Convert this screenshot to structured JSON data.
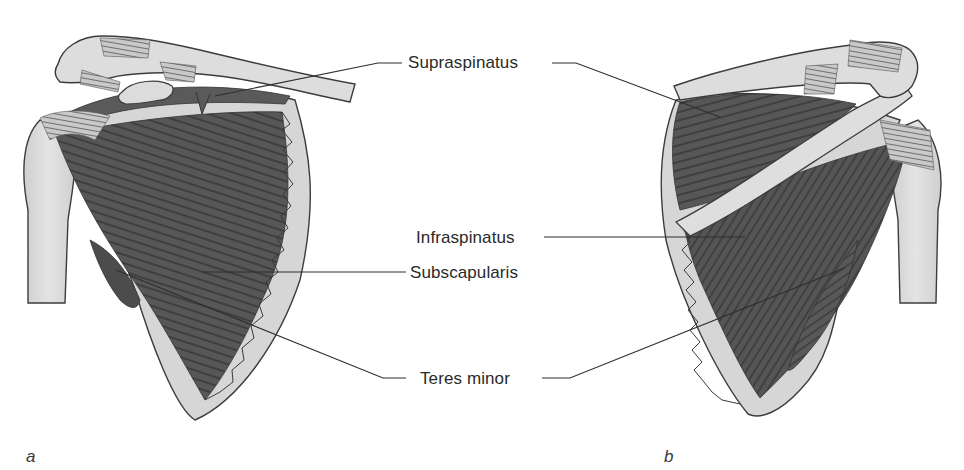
{
  "figure": {
    "panels": [
      {
        "id": "a",
        "letter": "a",
        "view": "anterior"
      },
      {
        "id": "b",
        "letter": "b",
        "view": "posterior"
      }
    ],
    "labels": {
      "supraspinatus": "Supraspinatus",
      "infraspinatus": "Infraspinatus",
      "subscapularis": "Subscapularis",
      "teres_minor": "Teres minor"
    },
    "colors": {
      "bone": "#d9d9d9",
      "bone_outline": "#3c3c3c",
      "muscle": "#555555",
      "muscle_fiber": "#3a3a3a",
      "tendon": "#8a8a8a",
      "leader_line": "#2e2e2e",
      "text": "#2a2a2a",
      "background": "#ffffff"
    }
  }
}
